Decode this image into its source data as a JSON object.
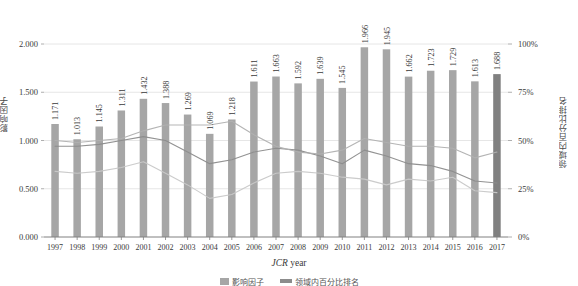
{
  "chart_data": {
    "type": "bar",
    "title": "",
    "subtitle": "",
    "xlabel": "JCR year",
    "ylabel": "影响因子",
    "y2label": "领域内百分比排名",
    "grid": true,
    "legend_position": "bottom",
    "categories": [
      "1997",
      "1998",
      "1999",
      "2000",
      "2001",
      "2002",
      "2003",
      "2004",
      "2005",
      "2006",
      "2007",
      "2008",
      "2009",
      "2010",
      "2011",
      "2012",
      "2013",
      "2014",
      "2015",
      "2016",
      "2017"
    ],
    "ylim": [
      0.0,
      2.0
    ],
    "yticks": [
      "0.000",
      "0.500",
      "1.000",
      "1.500",
      "2.000"
    ],
    "ytick_values": [
      0.0,
      0.5,
      1.0,
      1.5,
      2.0
    ],
    "y2lim": [
      0,
      100
    ],
    "y2ticks": [
      "0%",
      "25%",
      "50%",
      "75%",
      "100%"
    ],
    "y2tick_values": [
      0,
      25,
      50,
      75,
      100
    ],
    "bar_series": {
      "name": "影响因子",
      "color": "#a6a6a6",
      "highlight_color": "#808080",
      "highlight_category": "2017",
      "values": [
        1.171,
        1.013,
        1.145,
        1.311,
        1.432,
        1.388,
        1.269,
        1.069,
        1.218,
        1.611,
        1.663,
        1.592,
        1.639,
        1.545,
        1.966,
        1.945,
        1.662,
        1.723,
        1.729,
        1.613,
        1.688
      ],
      "data_labels": [
        "1.171",
        "1.013",
        "1.145",
        "1.311",
        "1.432",
        "1.388",
        "1.269",
        "1.069",
        "1.218",
        "1.611",
        "1.663",
        "1.592",
        "1.639",
        "1.545",
        "1.966",
        "1.945",
        "1.662",
        "1.723",
        "1.729",
        "1.613",
        "1.688"
      ]
    },
    "line_series": [
      {
        "name": "百分比排名 1",
        "color": "#8c8c8c",
        "axis": "right",
        "values": [
          47,
          47,
          48,
          50,
          52,
          50,
          44,
          38,
          40,
          44,
          46,
          45,
          42,
          38,
          45,
          42,
          38,
          37,
          34,
          29,
          28
        ]
      },
      {
        "name": "百分比排名 2",
        "color": "#b0b0b0",
        "axis": "right",
        "values": [
          50,
          49,
          50,
          51,
          55,
          58,
          58,
          58,
          60,
          53,
          47,
          44,
          43,
          45,
          51,
          49,
          47,
          47,
          46,
          41,
          44
        ]
      },
      {
        "name": "百分比排名 3",
        "color": "#c8c8c8",
        "axis": "right",
        "values": [
          34,
          33,
          34,
          36,
          39,
          33,
          27,
          20,
          22,
          28,
          33,
          34,
          33,
          31,
          30,
          27,
          30,
          29,
          31,
          24,
          23
        ]
      }
    ]
  },
  "plot_box": {
    "left": 44,
    "right": 508,
    "top": 44,
    "bottom": 237
  },
  "legend": {
    "items": [
      {
        "label": "影响因子",
        "type": "bar",
        "color": "#a6a6a6"
      },
      {
        "label": "领域内百分比排名",
        "type": "line",
        "color": "#8c8c8c"
      }
    ]
  }
}
